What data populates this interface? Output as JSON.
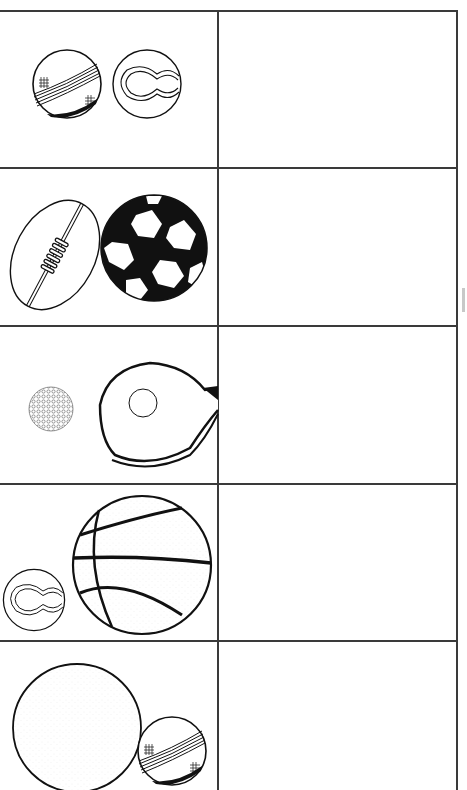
{
  "worksheet": {
    "columns": [
      "pictures",
      "answer"
    ],
    "rows": [
      {
        "index": 1,
        "items": [
          "cricket-ball",
          "tennis-ball"
        ],
        "answer": ""
      },
      {
        "index": 2,
        "items": [
          "rugby-ball",
          "soccer-ball"
        ],
        "answer": ""
      },
      {
        "index": 3,
        "items": [
          "golf-ball",
          "table-tennis-paddle"
        ],
        "answer": ""
      },
      {
        "index": 4,
        "items": [
          "tennis-ball",
          "basketball"
        ],
        "answer": ""
      },
      {
        "index": 5,
        "items": [
          "large-plain-ball",
          "cricket-ball"
        ],
        "answer": ""
      }
    ]
  },
  "colors": {
    "line": "#3a3a3a",
    "ink": "#111111",
    "paper": "#ffffff"
  }
}
